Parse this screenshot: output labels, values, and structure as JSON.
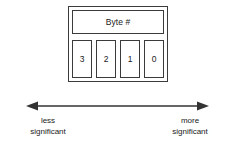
{
  "diagram": {
    "frame": {
      "header_label": "Byte #",
      "cells": [
        {
          "value": "3"
        },
        {
          "value": "2"
        },
        {
          "value": "1"
        },
        {
          "value": "0"
        }
      ]
    },
    "axis": {
      "style": "double-headed-arrow",
      "left_label": {
        "line1": "less",
        "line2": "significant"
      },
      "right_label": {
        "line1": "more",
        "line2": "significant"
      }
    },
    "colors": {
      "background": "#ffffff",
      "stroke": "#3b3b3b",
      "arrow": "#333333",
      "text": "#1a1a1a"
    }
  }
}
